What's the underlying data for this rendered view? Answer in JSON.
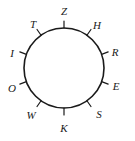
{
  "diagram": {
    "type": "labeled-circle",
    "title": "",
    "circle": {
      "center_x": 64,
      "center_y": 68,
      "radius": 40,
      "stroke_color": "#1a1a1a",
      "stroke_width": 1.6,
      "fill": "none"
    },
    "tick": {
      "inner_offset": 0,
      "length": 7,
      "stroke_color": "#1a1a1a",
      "stroke_width": 1.2
    },
    "label_radius": 53,
    "points": [
      {
        "label": "Z",
        "angle_deg": 90,
        "label_x": 64,
        "label_y": 11
      },
      {
        "label": "H",
        "angle_deg": 55,
        "label_x": 97,
        "label_y": 25
      },
      {
        "label": "R",
        "angle_deg": 20,
        "label_x": 115,
        "label_y": 52
      },
      {
        "label": "E",
        "angle_deg": -20,
        "label_x": 116,
        "label_y": 86
      },
      {
        "label": "S",
        "angle_deg": -55,
        "label_x": 99,
        "label_y": 114
      },
      {
        "label": "K",
        "angle_deg": -90,
        "label_x": 64,
        "label_y": 128
      },
      {
        "label": "W",
        "angle_deg": -125,
        "label_x": 31,
        "label_y": 115
      },
      {
        "label": "O",
        "angle_deg": -160,
        "label_x": 12,
        "label_y": 88
      },
      {
        "label": "I",
        "angle_deg": 160,
        "label_x": 12,
        "label_y": 53
      },
      {
        "label": "T",
        "angle_deg": 125,
        "label_x": 33,
        "label_y": 24
      }
    ]
  }
}
